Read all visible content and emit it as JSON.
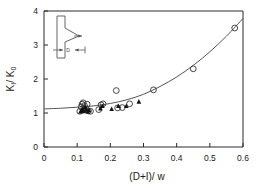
{
  "chart_data": {
    "type": "scatter",
    "title": "",
    "xlabel": "(D+I)/ w",
    "ylabel": "KI/ K0",
    "xlim": [
      0,
      0.6
    ],
    "ylim": [
      0,
      4
    ],
    "xticks": [
      0,
      0.1,
      0.2,
      0.3,
      0.4,
      0.5,
      0.6
    ],
    "xticklabels": [
      "0",
      "0.1",
      "0.2",
      "0.3",
      "0.4",
      "0.5",
      "0.6"
    ],
    "yticks": [
      0,
      1,
      2,
      3,
      4
    ],
    "yticklabels": [
      "0",
      "1",
      "2",
      "3",
      "4"
    ],
    "grid": false,
    "legend": null,
    "series": [
      {
        "name": "open-circle",
        "marker": "open-circle",
        "color": "#333333",
        "points": [
          [
            0.108,
            1.05
          ],
          [
            0.112,
            1.18
          ],
          [
            0.115,
            1.26
          ],
          [
            0.118,
            1.3
          ],
          [
            0.122,
            1.22
          ],
          [
            0.126,
            1.13
          ],
          [
            0.13,
            1.26
          ],
          [
            0.134,
            1.06
          ],
          [
            0.14,
            1.05
          ],
          [
            0.165,
            1.1
          ],
          [
            0.172,
            1.24
          ],
          [
            0.178,
            1.27
          ],
          [
            0.218,
            1.66
          ],
          [
            0.222,
            1.15
          ],
          [
            0.236,
            1.16
          ],
          [
            0.258,
            1.27
          ],
          [
            0.33,
            1.68
          ],
          [
            0.45,
            2.3
          ],
          [
            0.575,
            3.5
          ]
        ]
      },
      {
        "name": "filled-triangle",
        "marker": "filled-triangle",
        "color": "#111111",
        "points": [
          [
            0.11,
            1.04
          ],
          [
            0.114,
            1.08
          ],
          [
            0.117,
            1.12
          ],
          [
            0.12,
            1.05
          ],
          [
            0.124,
            1.16
          ],
          [
            0.128,
            1.1
          ],
          [
            0.132,
            1.04
          ],
          [
            0.136,
            1.08
          ],
          [
            0.17,
            1.13
          ],
          [
            0.176,
            1.2
          ],
          [
            0.204,
            1.11
          ],
          [
            0.224,
            1.2
          ],
          [
            0.248,
            1.2
          ],
          [
            0.286,
            1.33
          ]
        ]
      }
    ],
    "fit_curve": {
      "name": "fitted-curve",
      "color": "#555555",
      "points": [
        [
          0.0,
          1.12
        ],
        [
          0.05,
          1.14
        ],
        [
          0.1,
          1.17
        ],
        [
          0.15,
          1.21
        ],
        [
          0.2,
          1.28
        ],
        [
          0.25,
          1.39
        ],
        [
          0.3,
          1.55
        ],
        [
          0.35,
          1.78
        ],
        [
          0.4,
          2.06
        ],
        [
          0.45,
          2.4
        ],
        [
          0.5,
          2.8
        ],
        [
          0.55,
          3.26
        ],
        [
          0.6,
          3.78
        ]
      ]
    },
    "inset": {
      "name": "notch-schematic",
      "label_d": "D"
    }
  }
}
